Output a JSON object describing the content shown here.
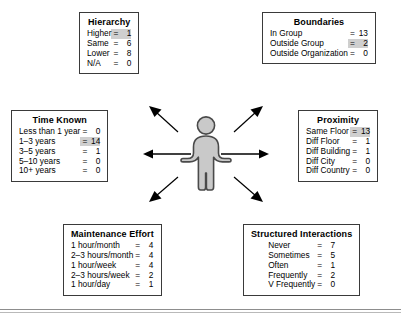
{
  "diagram": {
    "center": {
      "figure_icon": "person-figure-icon",
      "arrow_count": 6,
      "arrow_directions": [
        "left",
        "right",
        "up-left",
        "up-right",
        "down-left",
        "down-right"
      ]
    },
    "colors": {
      "highlight": "#cfcfcf",
      "border": "#3a3a3a",
      "figure_fill": "#c9c9c9",
      "figure_outline": "#4a4a4a",
      "arrow": "#000000",
      "rule_upper": "#8d8d8d",
      "rule_lower": "#b9b9b9"
    },
    "boxes": [
      {
        "id": "hierarchy",
        "title": "Hierarchy",
        "rows": [
          {
            "label": "Higher",
            "eq": "=",
            "value": "1",
            "highlight": true
          },
          {
            "label": "Same",
            "eq": "=",
            "value": "6",
            "highlight": false
          },
          {
            "label": "Lower",
            "eq": "=",
            "value": "8",
            "highlight": false
          },
          {
            "label": "N/A",
            "eq": "=",
            "value": "0",
            "highlight": false
          }
        ]
      },
      {
        "id": "boundaries",
        "title": "Boundaries",
        "rows": [
          {
            "label": "In Group",
            "eq": "=",
            "value": "13",
            "highlight": false
          },
          {
            "label": "Outside Group",
            "eq": "=",
            "value": "2",
            "highlight": true
          },
          {
            "label": "Outside Organization",
            "eq": "=",
            "value": "0",
            "highlight": false
          }
        ]
      },
      {
        "id": "time-known",
        "title": "Time Known",
        "rows": [
          {
            "label": "Less than 1 year",
            "eq": "=",
            "value": "0",
            "highlight": false
          },
          {
            "label": "1–3 years",
            "eq": "=",
            "value": "14",
            "highlight": true
          },
          {
            "label": "3–5 years",
            "eq": "=",
            "value": "1",
            "highlight": false
          },
          {
            "label": "5–10 years",
            "eq": "=",
            "value": "0",
            "highlight": false
          },
          {
            "label": "10+ years",
            "eq": "=",
            "value": "0",
            "highlight": false
          }
        ]
      },
      {
        "id": "proximity",
        "title": "Proximity",
        "rows": [
          {
            "label": "Same Floor",
            "eq": "=",
            "value": "13",
            "highlight": true
          },
          {
            "label": "Diff Floor",
            "eq": "=",
            "value": "1",
            "highlight": false
          },
          {
            "label": "Diff Building",
            "eq": "=",
            "value": "1",
            "highlight": false
          },
          {
            "label": "Diff City",
            "eq": "=",
            "value": "0",
            "highlight": false
          },
          {
            "label": "Diff Country",
            "eq": "=",
            "value": "0",
            "highlight": false
          }
        ]
      },
      {
        "id": "maintenance-effort",
        "title": "Maintenance Effort",
        "rows": [
          {
            "label": "1 hour/month",
            "eq": "=",
            "value": "4",
            "highlight": false
          },
          {
            "label": "2–3 hours/month",
            "eq": "=",
            "value": "4",
            "highlight": false
          },
          {
            "label": "1 hour/week",
            "eq": "=",
            "value": "4",
            "highlight": false
          },
          {
            "label": "2–3 hours/week",
            "eq": "=",
            "value": "2",
            "highlight": false
          },
          {
            "label": "1 hour/day",
            "eq": "=",
            "value": "1",
            "highlight": false
          }
        ]
      },
      {
        "id": "structured-interactions",
        "title": "Structured Interactions",
        "rows": [
          {
            "label": "Never",
            "eq": "=",
            "value": "7",
            "highlight": false
          },
          {
            "label": "Sometimes",
            "eq": "=",
            "value": "5",
            "highlight": false
          },
          {
            "label": "Often",
            "eq": "=",
            "value": "1",
            "highlight": false
          },
          {
            "label": "Frequently",
            "eq": "=",
            "value": "2",
            "highlight": false
          },
          {
            "label": "V Frequently",
            "eq": "=",
            "value": "0",
            "highlight": false
          }
        ]
      }
    ]
  }
}
